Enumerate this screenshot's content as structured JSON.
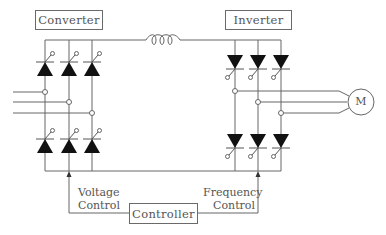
{
  "diagram": {
    "title_converter": "Converter",
    "title_inverter": "Inverter",
    "controller": "Controller",
    "voltage_control_line1": "Voltage",
    "voltage_control_line2": "Control",
    "frequency_control_line1": "Frequency",
    "frequency_control_line2": "Control",
    "motor_label": "M"
  },
  "components": {
    "converter": {
      "thyristors": 6,
      "orientation": "upward",
      "phases": 3
    },
    "dc_link": {
      "element": "inductor",
      "coils": 3
    },
    "inverter": {
      "thyristors": 6,
      "orientation": "downward",
      "phases": 3
    },
    "motor": {
      "symbol": "M"
    }
  },
  "colors": {
    "line": "#555555",
    "thyristor_fill": "#111111",
    "text": "#555555"
  }
}
